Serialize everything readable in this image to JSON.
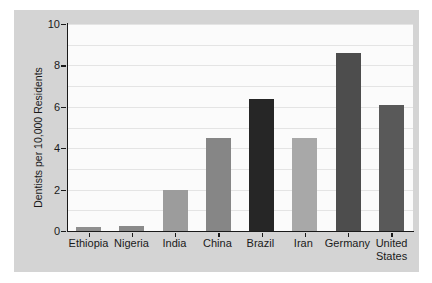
{
  "page": {
    "background": "#ffffff"
  },
  "figure": {
    "background": "#d4d4d4"
  },
  "chart_data": {
    "type": "bar",
    "title": "",
    "xlabel": "",
    "ylabel": "Dentists per 10,000 Residents",
    "ylim": [
      0,
      10
    ],
    "yticks": [
      0,
      2,
      4,
      6,
      8,
      10
    ],
    "grid": "horizontal gridlines at every 1 unit",
    "legend": "none",
    "plot_background": "#fbfbfb",
    "gridline_color": "#e4e4e4",
    "axis_color": "#1a1a1a",
    "text_color": "#1a1a1a",
    "categories": [
      "Ethiopia",
      "Nigeria",
      "India",
      "China",
      "Brazil",
      "Iran",
      "Germany",
      "United States"
    ],
    "values": [
      0.2,
      0.25,
      2.0,
      4.5,
      6.4,
      4.5,
      8.6,
      6.1
    ],
    "bar_colors": [
      "#8f8f8f",
      "#8a8a8a",
      "#9c9c9c",
      "#868686",
      "#262626",
      "#a8a8a8",
      "#4d4d4d",
      "#595959"
    ]
  }
}
